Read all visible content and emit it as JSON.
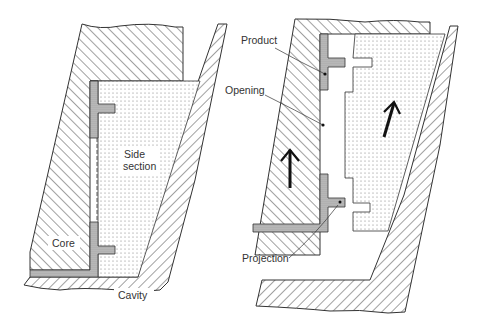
{
  "diagram": {
    "left_panel": {
      "labels": {
        "side_section_line1": "Side",
        "side_section_line2": "section",
        "core": "Core",
        "cavity": "Cavity"
      }
    },
    "right_panel": {
      "labels": {
        "product": "Product",
        "opening": "Opening",
        "projection": "Projection"
      },
      "arrows": [
        "arrow-up-core",
        "arrow-up-side-section"
      ]
    },
    "colors": {
      "stroke": "#333333",
      "hatch": "#444444",
      "product_fill": "#bdbdbd",
      "background": "#ffffff"
    }
  }
}
